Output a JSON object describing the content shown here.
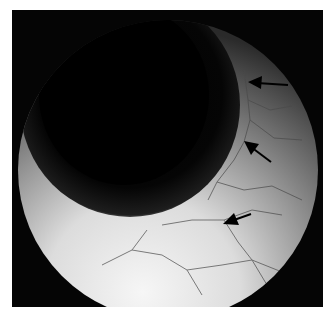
{
  "image": {
    "kind": "endoscopic grayscale photograph",
    "frame_color": "#050505",
    "annotations": [
      {
        "type": "arrow",
        "tip": [
          248,
          82
        ],
        "tail": [
          288,
          85
        ]
      },
      {
        "type": "arrow",
        "tip": [
          246,
          142
        ],
        "tail": [
          271,
          162
        ]
      },
      {
        "type": "arrow",
        "tip": [
          224,
          223
        ],
        "tail": [
          251,
          214
        ]
      }
    ]
  }
}
